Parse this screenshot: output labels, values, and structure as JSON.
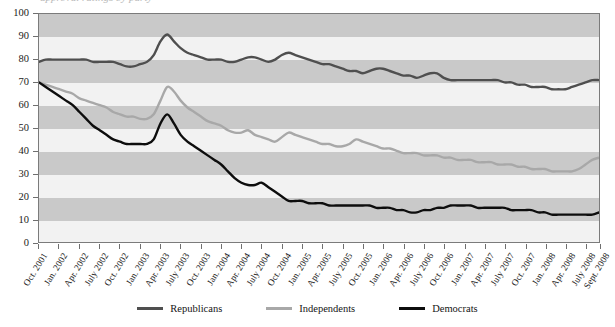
{
  "title_remnant": "approval ratings by party",
  "colors": {
    "republicans": "#4f4f4f",
    "independents": "#a8a8a8",
    "democrats": "#0d0d0d",
    "band_dark": "#c9c9c9",
    "band_light": "#f2f2f2",
    "axis": "#6f6f6f"
  },
  "legend": {
    "items": [
      {
        "label": "Republicans",
        "color": "#4f4f4f"
      },
      {
        "label": "Independents",
        "color": "#a8a8a8"
      },
      {
        "label": "Democrats",
        "color": "#0d0d0d"
      }
    ]
  },
  "chart_data": {
    "type": "line",
    "title": "approval ratings by party",
    "xlabel": "",
    "ylabel": "",
    "ylim": [
      0,
      100
    ],
    "ytick_step": 10,
    "yticks": [
      0,
      10,
      20,
      30,
      40,
      50,
      60,
      70,
      80,
      90,
      100
    ],
    "grid": false,
    "banding": "alternating horizontal gray bands every 10 units",
    "legend_position": "bottom-center",
    "xtick_labels": [
      "Oct. 2001",
      "Jan. 2002",
      "Apr. 2002",
      "July 2002",
      "Oct. 2002",
      "Jan. 2003",
      "Apr. 2003",
      "July 2003",
      "Oct. 2003",
      "Jan. 2004",
      "Apr. 2004",
      "July 2004",
      "Oct. 2004",
      "Jan. 2005",
      "Apr. 2005",
      "July 2005",
      "Oct. 2005",
      "Jan. 2006",
      "Apr. 2006",
      "July 2006",
      "Oct. 2006",
      "Jan. 2007",
      "Apr. 2007",
      "July 2007",
      "Oct. 2007",
      "Jan. 2008",
      "Apr. 2008",
      "July 2008",
      "Sept. 2008"
    ],
    "x_months": [
      "2001-10",
      "2001-11",
      "2001-12",
      "2002-01",
      "2002-02",
      "2002-03",
      "2002-04",
      "2002-05",
      "2002-06",
      "2002-07",
      "2002-08",
      "2002-09",
      "2002-10",
      "2002-11",
      "2002-12",
      "2003-01",
      "2003-02",
      "2003-03",
      "2003-04",
      "2003-05",
      "2003-06",
      "2003-07",
      "2003-08",
      "2003-09",
      "2003-10",
      "2003-11",
      "2003-12",
      "2004-01",
      "2004-02",
      "2004-03",
      "2004-04",
      "2004-05",
      "2004-06",
      "2004-07",
      "2004-08",
      "2004-09",
      "2004-10",
      "2004-11",
      "2004-12",
      "2005-01",
      "2005-02",
      "2005-03",
      "2005-04",
      "2005-05",
      "2005-06",
      "2005-07",
      "2005-08",
      "2005-09",
      "2005-10",
      "2005-11",
      "2005-12",
      "2006-01",
      "2006-02",
      "2006-03",
      "2006-04",
      "2006-05",
      "2006-06",
      "2006-07",
      "2006-08",
      "2006-09",
      "2006-10",
      "2006-11",
      "2006-12",
      "2007-01",
      "2007-02",
      "2007-03",
      "2007-04",
      "2007-05",
      "2007-06",
      "2007-07",
      "2007-08",
      "2007-09",
      "2007-10",
      "2007-11",
      "2007-12",
      "2008-01",
      "2008-02",
      "2008-03",
      "2008-04",
      "2008-05",
      "2008-06",
      "2008-07",
      "2008-08",
      "2008-09"
    ],
    "series": [
      {
        "name": "Republicans",
        "color": "#4f4f4f",
        "values": [
          79,
          80,
          80,
          80,
          80,
          80,
          80,
          80,
          79,
          79,
          79,
          79,
          78,
          77,
          77,
          78,
          79,
          82,
          88,
          91,
          88,
          85,
          83,
          82,
          81,
          80,
          80,
          80,
          79,
          79,
          80,
          81,
          81,
          80,
          79,
          80,
          82,
          83,
          82,
          81,
          80,
          79,
          78,
          78,
          77,
          76,
          75,
          75,
          74,
          75,
          76,
          76,
          75,
          74,
          73,
          73,
          72,
          73,
          74,
          74,
          72,
          71,
          71,
          71,
          71,
          71,
          71,
          71,
          71,
          70,
          70,
          69,
          69,
          68,
          68,
          68,
          67,
          67,
          67,
          68,
          69,
          70,
          71,
          71
        ]
      },
      {
        "name": "Independents",
        "color": "#a8a8a8",
        "values": [
          70,
          69,
          68,
          67,
          66,
          65,
          63,
          62,
          61,
          60,
          59,
          57,
          56,
          55,
          55,
          54,
          54,
          56,
          62,
          68,
          66,
          62,
          59,
          57,
          55,
          53,
          52,
          51,
          49,
          48,
          48,
          49,
          47,
          46,
          45,
          44,
          46,
          48,
          47,
          46,
          45,
          44,
          43,
          43,
          42,
          42,
          43,
          45,
          44,
          43,
          42,
          41,
          41,
          40,
          39,
          39,
          39,
          38,
          38,
          38,
          37,
          37,
          36,
          36,
          36,
          35,
          35,
          35,
          34,
          34,
          34,
          33,
          33,
          32,
          32,
          32,
          31,
          31,
          31,
          31,
          32,
          34,
          36,
          37
        ]
      },
      {
        "name": "Democrats",
        "color": "#0d0d0d",
        "values": [
          70,
          68,
          66,
          64,
          62,
          60,
          57,
          54,
          51,
          49,
          47,
          45,
          44,
          43,
          43,
          43,
          43,
          45,
          52,
          56,
          52,
          47,
          44,
          42,
          40,
          38,
          36,
          34,
          31,
          28,
          26,
          25,
          25,
          26,
          24,
          22,
          20,
          18,
          18,
          18,
          17,
          17,
          17,
          16,
          16,
          16,
          16,
          16,
          16,
          16,
          15,
          15,
          15,
          14,
          14,
          13,
          13,
          14,
          14,
          15,
          15,
          16,
          16,
          16,
          16,
          15,
          15,
          15,
          15,
          15,
          14,
          14,
          14,
          14,
          13,
          13,
          12,
          12,
          12,
          12,
          12,
          12,
          12,
          13
        ]
      }
    ]
  }
}
